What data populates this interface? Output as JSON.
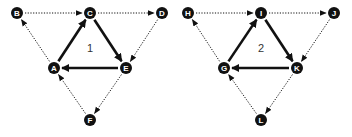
{
  "colors": {
    "node": "#111111",
    "node_text": "#ffffff",
    "edge": "#111111",
    "label": "#333333"
  },
  "graphs": [
    {
      "label": "1",
      "label_pos": [
        90,
        52
      ],
      "nodes": [
        {
          "id": "B",
          "x": 17,
          "y": 13
        },
        {
          "id": "C",
          "x": 90,
          "y": 13
        },
        {
          "id": "D",
          "x": 162,
          "y": 13
        },
        {
          "id": "A",
          "x": 54,
          "y": 68
        },
        {
          "id": "E",
          "x": 126,
          "y": 68
        },
        {
          "id": "F",
          "x": 90,
          "y": 120
        }
      ],
      "edges": [
        {
          "from": "A",
          "to": "C",
          "style": "solid"
        },
        {
          "from": "C",
          "to": "E",
          "style": "solid"
        },
        {
          "from": "E",
          "to": "A",
          "style": "solid"
        },
        {
          "from": "B",
          "to": "C",
          "style": "dotted"
        },
        {
          "from": "C",
          "to": "D",
          "style": "dotted"
        },
        {
          "from": "D",
          "to": "E",
          "style": "dotted"
        },
        {
          "from": "E",
          "to": "F",
          "style": "dotted"
        },
        {
          "from": "F",
          "to": "A",
          "style": "dotted"
        },
        {
          "from": "A",
          "to": "B",
          "style": "dotted"
        }
      ]
    },
    {
      "label": "2",
      "label_pos": [
        261,
        52
      ],
      "nodes": [
        {
          "id": "H",
          "x": 188,
          "y": 13
        },
        {
          "id": "I",
          "x": 261,
          "y": 13
        },
        {
          "id": "J",
          "x": 334,
          "y": 13
        },
        {
          "id": "G",
          "x": 224,
          "y": 68
        },
        {
          "id": "K",
          "x": 297,
          "y": 68
        },
        {
          "id": "L",
          "x": 261,
          "y": 120
        }
      ],
      "edges": [
        {
          "from": "G",
          "to": "I",
          "style": "solid"
        },
        {
          "from": "I",
          "to": "K",
          "style": "solid"
        },
        {
          "from": "K",
          "to": "G",
          "style": "solid"
        },
        {
          "from": "H",
          "to": "I",
          "style": "dotted"
        },
        {
          "from": "I",
          "to": "J",
          "style": "dotted"
        },
        {
          "from": "J",
          "to": "K",
          "style": "dotted"
        },
        {
          "from": "K",
          "to": "L",
          "style": "dotted"
        },
        {
          "from": "L",
          "to": "G",
          "style": "dotted"
        },
        {
          "from": "G",
          "to": "H",
          "style": "dotted"
        }
      ]
    }
  ]
}
